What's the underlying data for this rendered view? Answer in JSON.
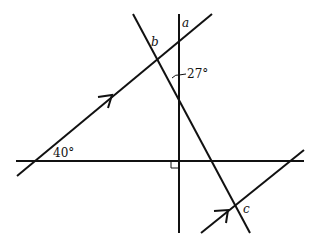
{
  "diagram": {
    "type": "geometry",
    "labels": {
      "a": "a",
      "b": "b",
      "c": "c",
      "angle_27": "27°",
      "angle_40": "40°"
    },
    "elements": [
      {
        "name": "vertical-line",
        "from": [
          179,
          14
        ],
        "to": [
          179,
          233
        ]
      },
      {
        "name": "horizontal-line",
        "from": [
          16,
          161
        ],
        "to": [
          304,
          161
        ]
      },
      {
        "name": "parallel-line-upper",
        "from": [
          17,
          176
        ],
        "to": [
          212,
          14
        ],
        "arrow": true
      },
      {
        "name": "parallel-line-lower",
        "from": [
          201,
          233
        ],
        "to": [
          304,
          150
        ],
        "arrow": true
      },
      {
        "name": "transversal-line",
        "from": [
          133,
          14
        ],
        "to": [
          250,
          233
        ]
      }
    ],
    "right_angle_marker": {
      "at": [
        179,
        161
      ]
    },
    "colors": {
      "line": "#111111",
      "background": "#ffffff"
    }
  }
}
